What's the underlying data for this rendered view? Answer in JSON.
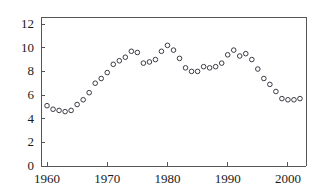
{
  "chart_data": {
    "type": "scatter",
    "title": "",
    "subtitle": "",
    "xlabel": "",
    "ylabel": "",
    "xlim": [
      1959,
      2003
    ],
    "ylim": [
      0,
      12.6
    ],
    "grid": false,
    "legend": null,
    "marker": "open-circle",
    "marker_color": "#3a3a44",
    "axis_color": "#555555",
    "xticks": [
      1960,
      1970,
      1980,
      1990,
      2000
    ],
    "xtick_labels": [
      "1960",
      "1970",
      "1980",
      "1990",
      "2000"
    ],
    "yticks": [
      0,
      2,
      4,
      6,
      8,
      10,
      12
    ],
    "ytick_labels": [
      "0",
      "2",
      "4",
      "6",
      "8",
      "10",
      "12"
    ],
    "x": [
      1960,
      1961,
      1962,
      1963,
      1964,
      1965,
      1966,
      1967,
      1968,
      1969,
      1970,
      1971,
      1972,
      1973,
      1974,
      1975,
      1976,
      1977,
      1978,
      1979,
      1980,
      1981,
      1982,
      1983,
      1984,
      1985,
      1986,
      1987,
      1988,
      1989,
      1990,
      1991,
      1992,
      1993,
      1994,
      1995,
      1996,
      1997,
      1998,
      1999,
      2000,
      2001,
      2002
    ],
    "y": [
      5.1,
      4.8,
      4.7,
      4.6,
      4.7,
      5.2,
      5.6,
      6.2,
      7.0,
      7.4,
      7.9,
      8.6,
      8.9,
      9.2,
      9.7,
      9.6,
      8.7,
      8.8,
      9.0,
      9.7,
      10.2,
      9.8,
      9.1,
      8.3,
      8.0,
      8.0,
      8.4,
      8.3,
      8.4,
      8.7,
      9.4,
      9.8,
      9.3,
      9.5,
      9.0,
      8.2,
      7.4,
      6.9,
      6.3,
      5.7,
      5.6,
      5.6,
      5.7
    ]
  }
}
